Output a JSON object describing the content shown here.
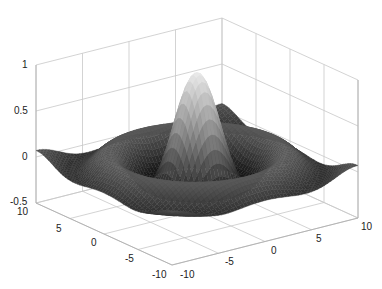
{
  "chart_data": {
    "type": "surface",
    "title": "",
    "function": "z = sin(r)/r, r = sqrt(x^2 + y^2)",
    "xlabel": "",
    "ylabel": "",
    "zlabel": "",
    "x_range": [
      -10,
      10
    ],
    "y_range": [
      -10,
      10
    ],
    "zlim": [
      -0.5,
      1
    ],
    "grid": true,
    "colormap": "gray",
    "x_ticks": [
      "-10",
      "-5",
      "0",
      "5",
      "10"
    ],
    "y_ticks": [
      "-10",
      "-5",
      "0",
      "5",
      "10"
    ],
    "z_ticks": [
      "-0.5",
      "0",
      "0.5",
      "1"
    ],
    "samples": {
      "r": [
        0,
        2,
        3.14,
        4.49,
        6.28,
        7.73,
        10,
        14.14
      ],
      "z": [
        1.0,
        0.455,
        0.0,
        -0.217,
        0.0,
        0.128,
        -0.054,
        0.07
      ]
    },
    "peak": {
      "x": 0,
      "y": 0,
      "z": 1.0
    }
  },
  "axes": {
    "z_tick_labels": [
      "1",
      "0.5",
      "0",
      "-0.5"
    ],
    "left_tick_labels": [
      "10",
      "5",
      "0",
      "-5",
      "-10"
    ],
    "right_tick_labels": [
      "-10",
      "-5",
      "0",
      "5",
      "10"
    ]
  }
}
